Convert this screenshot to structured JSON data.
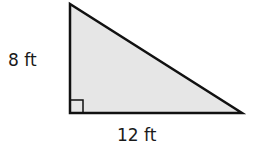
{
  "figure": {
    "shape": "right-triangle",
    "fill_color": "#e6e6e6",
    "stroke_color": "#111111",
    "vertical_leg": {
      "label": "8 ft",
      "length": 8,
      "unit": "ft"
    },
    "horizontal_leg": {
      "label": "12 ft",
      "length": 12,
      "unit": "ft"
    },
    "right_angle_marker": true
  }
}
